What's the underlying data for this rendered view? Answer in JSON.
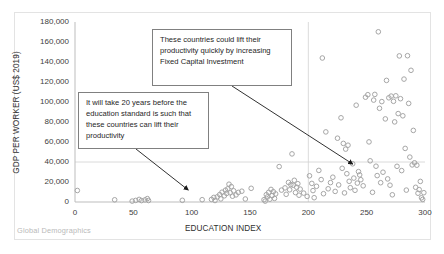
{
  "watermark": "Global Demographics",
  "annotations": [
    {
      "id": "callout-top",
      "text": "These countries could lift their productivity quickly by increasing  Fixed Capital Investment",
      "arrow_to": {
        "x": 238,
        "y": 38000
      }
    },
    {
      "id": "callout-left",
      "text": "It will take 20 years before the education standard is such that these countries can lift their productivity",
      "arrow_to": {
        "x": 97,
        "y": 12000
      }
    }
  ],
  "chart_data": {
    "type": "scatter",
    "title": "",
    "xlabel": "EDUCATION INDEX",
    "ylabel": "GDP PER WORKER (US$ 2019)",
    "xlim": [
      0,
      300
    ],
    "ylim": [
      0,
      180000
    ],
    "xticks": [
      0,
      50,
      100,
      150,
      200,
      250,
      300
    ],
    "yticks": [
      0,
      20000,
      40000,
      60000,
      80000,
      100000,
      120000,
      140000,
      160000,
      180000
    ],
    "xtick_labels": [
      "0",
      "50",
      "100",
      "150",
      "200",
      "250",
      "300"
    ],
    "ytick_labels": [
      "0",
      "20,000",
      "40,000",
      "60,000",
      "80,000",
      "100,000",
      "120,000",
      "140,000",
      "160,000",
      "180,000"
    ],
    "grid": {
      "horizontal_at": [
        40000
      ],
      "vertical_at": [
        200
      ]
    },
    "legend": null,
    "marker": {
      "shape": "circle-open",
      "color": "#a6a6a6",
      "size": 4.6
    },
    "series": [
      {
        "name": "Countries",
        "points": [
          [
            2,
            11500
          ],
          [
            34,
            2200
          ],
          [
            49,
            900
          ],
          [
            52,
            1600
          ],
          [
            55,
            2600
          ],
          [
            57,
            1400
          ],
          [
            60,
            2100
          ],
          [
            62,
            3400
          ],
          [
            63,
            1500
          ],
          [
            92,
            1700
          ],
          [
            109,
            2300
          ],
          [
            117,
            2600
          ],
          [
            119,
            4600
          ],
          [
            120,
            1500
          ],
          [
            122,
            5200
          ],
          [
            124,
            7400
          ],
          [
            125,
            3100
          ],
          [
            126,
            9800
          ],
          [
            128,
            6200
          ],
          [
            129,
            11800
          ],
          [
            130,
            8600
          ],
          [
            131,
            13200
          ],
          [
            132,
            17800
          ],
          [
            133,
            9200
          ],
          [
            134,
            15400
          ],
          [
            135,
            5800
          ],
          [
            136,
            11200
          ],
          [
            138,
            7100
          ],
          [
            140,
            9600
          ],
          [
            143,
            10800
          ],
          [
            146,
            3000
          ],
          [
            151,
            13700
          ],
          [
            162,
            2300
          ],
          [
            163,
            900
          ],
          [
            164,
            7300
          ],
          [
            165,
            5100
          ],
          [
            166,
            9700
          ],
          [
            167,
            2800
          ],
          [
            168,
            12600
          ],
          [
            169,
            6400
          ],
          [
            170,
            10300
          ],
          [
            171,
            3600
          ],
          [
            172,
            8100
          ],
          [
            175,
            35400
          ],
          [
            177,
            11900
          ],
          [
            180,
            14100
          ],
          [
            181,
            7700
          ],
          [
            183,
            19600
          ],
          [
            184,
            12200
          ],
          [
            185,
            17400
          ],
          [
            186,
            48100
          ],
          [
            187,
            16800
          ],
          [
            188,
            21700
          ],
          [
            189,
            9400
          ],
          [
            190,
            14800
          ],
          [
            191,
            18300
          ],
          [
            192,
            6800
          ],
          [
            193,
            12900
          ],
          [
            196,
            8900
          ],
          [
            199,
            5600
          ],
          [
            201,
            26200
          ],
          [
            203,
            18600
          ],
          [
            204,
            11400
          ],
          [
            205,
            4300
          ],
          [
            207,
            15700
          ],
          [
            209,
            31600
          ],
          [
            211,
            22400
          ],
          [
            212,
            144000
          ],
          [
            213,
            8300
          ],
          [
            215,
            70100
          ],
          [
            217,
            13200
          ],
          [
            219,
            19400
          ],
          [
            221,
            24800
          ],
          [
            223,
            10600
          ],
          [
            225,
            63800
          ],
          [
            226,
            17100
          ],
          [
            228,
            84200
          ],
          [
            229,
            33700
          ],
          [
            230,
            58600
          ],
          [
            231,
            9100
          ],
          [
            232,
            52900
          ],
          [
            233,
            28300
          ],
          [
            234,
            56800
          ],
          [
            235,
            20700
          ],
          [
            236,
            14300
          ],
          [
            238,
            38200
          ],
          [
            239,
            23900
          ],
          [
            240,
            11700
          ],
          [
            241,
            96800
          ],
          [
            242,
            18900
          ],
          [
            243,
            30400
          ],
          [
            244,
            27100
          ],
          [
            245,
            22300
          ],
          [
            247,
            16200
          ],
          [
            249,
            104800
          ],
          [
            251,
            107300
          ],
          [
            252,
            60100
          ],
          [
            253,
            41200
          ],
          [
            255,
            9700
          ],
          [
            256,
            101900
          ],
          [
            257,
            107600
          ],
          [
            258,
            35800
          ],
          [
            259,
            26400
          ],
          [
            260,
            170200
          ],
          [
            261,
            93700
          ],
          [
            262,
            19300
          ],
          [
            263,
            100400
          ],
          [
            264,
            29800
          ],
          [
            266,
            83100
          ],
          [
            267,
            121600
          ],
          [
            268,
            23100
          ],
          [
            269,
            104200
          ],
          [
            270,
            16800
          ],
          [
            271,
            105900
          ],
          [
            272,
            7200
          ],
          [
            273,
            100700
          ],
          [
            274,
            80100
          ],
          [
            275,
            106200
          ],
          [
            276,
            35700
          ],
          [
            277,
            88400
          ],
          [
            278,
            146100
          ],
          [
            279,
            103300
          ],
          [
            280,
            31400
          ],
          [
            281,
            86200
          ],
          [
            282,
            122900
          ],
          [
            283,
            53600
          ],
          [
            284,
            11900
          ],
          [
            285,
            146300
          ],
          [
            286,
            98600
          ],
          [
            287,
            44900
          ],
          [
            288,
            131700
          ],
          [
            289,
            37100
          ],
          [
            290,
            71600
          ],
          [
            291,
            39200
          ],
          [
            292,
            14700
          ],
          [
            293,
            36800
          ],
          [
            294,
            8800
          ],
          [
            295,
            12400
          ],
          [
            296,
            20600
          ],
          [
            297,
            4200
          ],
          [
            298,
            2600
          ],
          [
            299,
            9300
          ]
        ]
      }
    ]
  }
}
